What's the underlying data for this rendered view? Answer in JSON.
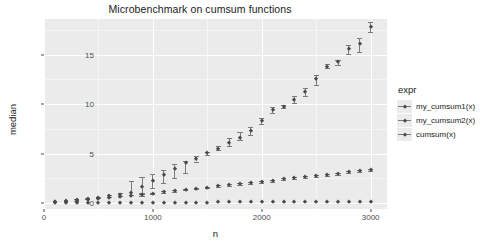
{
  "chart_data": {
    "type": "scatter",
    "title": "Microbenchmark on cumsum functions",
    "xlabel": "n",
    "ylabel": "median",
    "xlim": [
      0,
      3150
    ],
    "ylim": [
      -0.6,
      18.6
    ],
    "xticks": [
      0,
      1000,
      2000,
      3000
    ],
    "xtick_labels": [
      "0",
      "1000",
      "2000",
      "3000"
    ],
    "yticks": [
      0,
      5,
      10,
      15
    ],
    "ytick_labels": [
      "0",
      "5",
      "10",
      "15"
    ],
    "grid": true,
    "legend_position": "right",
    "legend_title": "expr",
    "x": [
      100,
      200,
      300,
      400,
      500,
      600,
      700,
      800,
      900,
      1000,
      1100,
      1200,
      1300,
      1400,
      1500,
      1600,
      1700,
      1800,
      1900,
      2000,
      2100,
      2200,
      2300,
      2400,
      2500,
      2600,
      2700,
      2800,
      2900,
      3000
    ],
    "series": [
      {
        "name": "my_cumsum1(x)",
        "values": [
          0.12,
          0.21,
          0.3,
          0.45,
          0.55,
          0.7,
          0.85,
          1.0,
          1.6,
          2.2,
          2.8,
          3.4,
          4.0,
          4.5,
          5.05,
          5.5,
          6.1,
          6.6,
          7.3,
          8.3,
          9.4,
          9.75,
          10.4,
          11.2,
          12.5,
          13.8,
          14.25,
          15.55,
          16.1,
          17.8
        ],
        "err_low": [
          0.1,
          0.18,
          0.25,
          0.38,
          0.48,
          0.6,
          0.72,
          0.8,
          1.0,
          1.55,
          2.0,
          2.55,
          3.0,
          4.2,
          4.9,
          5.35,
          5.8,
          6.35,
          6.9,
          7.95,
          9.1,
          9.6,
          10.1,
          10.8,
          11.9,
          13.6,
          14.0,
          15.1,
          15.3,
          17.3
        ],
        "err_high": [
          0.15,
          0.25,
          0.38,
          0.55,
          0.65,
          0.82,
          1.0,
          2.2,
          2.6,
          2.95,
          3.3,
          3.95,
          4.3,
          4.75,
          5.2,
          5.75,
          6.55,
          7.2,
          7.7,
          8.6,
          9.7,
          9.95,
          10.8,
          11.6,
          12.9,
          14.05,
          14.5,
          16.0,
          16.7,
          18.3
        ]
      },
      {
        "name": "my_cumsum2(x)",
        "values": [
          0.1,
          0.15,
          0.22,
          0.3,
          0.38,
          0.48,
          0.58,
          0.68,
          0.8,
          0.95,
          1.1,
          1.2,
          1.35,
          1.45,
          1.55,
          1.7,
          1.8,
          1.9,
          2.05,
          2.15,
          2.25,
          2.4,
          2.5,
          2.6,
          2.7,
          2.8,
          2.9,
          3.1,
          3.2,
          3.35
        ],
        "err_low": [
          0.08,
          0.13,
          0.2,
          0.27,
          0.35,
          0.44,
          0.54,
          0.63,
          0.75,
          0.9,
          1.04,
          1.14,
          1.28,
          1.38,
          1.48,
          1.62,
          1.72,
          1.82,
          1.96,
          2.06,
          2.16,
          2.3,
          2.4,
          2.5,
          2.6,
          2.7,
          2.8,
          3.0,
          3.1,
          3.24
        ],
        "err_high": [
          0.13,
          0.19,
          0.26,
          0.35,
          0.43,
          0.54,
          0.64,
          0.75,
          0.88,
          1.03,
          1.18,
          1.28,
          1.44,
          1.54,
          1.64,
          1.8,
          1.9,
          2.0,
          2.16,
          2.26,
          2.36,
          2.52,
          2.62,
          2.72,
          2.82,
          2.92,
          3.02,
          3.22,
          3.32,
          3.48
        ]
      },
      {
        "name": "cumsum(x)",
        "values": [
          0.02,
          0.02,
          0.02,
          0.03,
          0.03,
          0.03,
          0.03,
          0.04,
          0.04,
          0.04,
          0.04,
          0.05,
          0.05,
          0.05,
          0.05,
          0.06,
          0.06,
          0.06,
          0.06,
          0.07,
          0.07,
          0.07,
          0.07,
          0.08,
          0.08,
          0.08,
          0.08,
          0.09,
          0.09,
          0.09
        ],
        "err_low": [
          0.01,
          0.01,
          0.01,
          0.02,
          0.02,
          0.02,
          0.02,
          0.03,
          0.03,
          0.03,
          0.03,
          0.04,
          0.04,
          0.04,
          0.04,
          0.05,
          0.05,
          0.05,
          0.05,
          0.06,
          0.06,
          0.06,
          0.06,
          0.07,
          0.07,
          0.07,
          0.07,
          0.08,
          0.08,
          0.08
        ],
        "err_high": [
          0.03,
          0.03,
          0.03,
          0.04,
          0.04,
          0.04,
          0.04,
          0.05,
          0.05,
          0.05,
          0.05,
          0.06,
          0.06,
          0.06,
          0.06,
          0.07,
          0.07,
          0.07,
          0.07,
          0.08,
          0.08,
          0.08,
          0.08,
          0.09,
          0.09,
          0.09,
          0.09,
          0.1,
          0.1,
          0.1
        ]
      }
    ]
  },
  "legend": {
    "title": "expr",
    "items": [
      {
        "label": "my_cumsum1(x)"
      },
      {
        "label": "my_cumsum2(x)"
      },
      {
        "label": "cumsum(x)"
      }
    ]
  },
  "colors": {
    "panel_background": "#ebebeb",
    "grid_major": "#ffffff",
    "grid_minor": "#f5f5f5",
    "point": "#4a4a4a",
    "errorbar": "#7a7a7a",
    "text": "#1a1a1a",
    "axis_text": "#4d4d4d",
    "page_background": "#ffffff"
  }
}
